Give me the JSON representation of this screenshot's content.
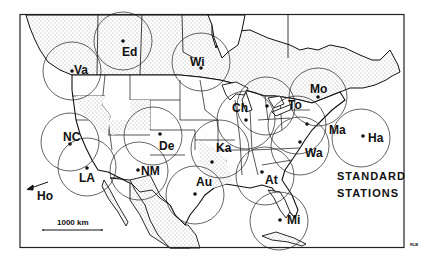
{
  "map": {
    "title_line1": "STANDARD",
    "title_line2": "STATIONS",
    "credit": "RLB",
    "scale_label": "1000 km",
    "offmap_station": {
      "code": "Ho",
      "arrow": "arrow-left-icon"
    },
    "colors": {
      "ink": "#111111",
      "land_stipple": "#555555",
      "paper": "#fefefe"
    },
    "stations": [
      {
        "code": "Va",
        "name": "Vancouver"
      },
      {
        "code": "Ed",
        "name": "Edmonton"
      },
      {
        "code": "Wi",
        "name": "Winnipeg"
      },
      {
        "code": "NC",
        "name": "Northern California"
      },
      {
        "code": "LA",
        "name": "Los Angeles"
      },
      {
        "code": "De",
        "name": "Denver"
      },
      {
        "code": "NM",
        "name": "New Mexico"
      },
      {
        "code": "Ka",
        "name": "Kansas City"
      },
      {
        "code": "Au",
        "name": "Austin"
      },
      {
        "code": "Ch",
        "name": "Chicago"
      },
      {
        "code": "To",
        "name": "Toronto"
      },
      {
        "code": "Mo",
        "name": "Montreal"
      },
      {
        "code": "Ma",
        "name": "Massachusetts"
      },
      {
        "code": "Ha",
        "name": "Halifax"
      },
      {
        "code": "Wa",
        "name": "Washington"
      },
      {
        "code": "At",
        "name": "Atlanta"
      },
      {
        "code": "Mi",
        "name": "Miami"
      }
    ]
  }
}
